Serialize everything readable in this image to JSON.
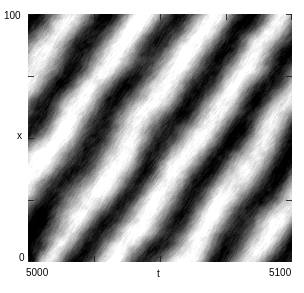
{
  "figure": {
    "kind": "space-time-density-plot",
    "background_color": "#ffffff",
    "plot_frame": {
      "left": 28,
      "top": 14,
      "width": 264,
      "height": 248
    }
  },
  "axes": {
    "x": {
      "label": "t",
      "min_tick_label": "5000",
      "max_tick_label": "5100",
      "range": [
        5000,
        5100
      ],
      "tick_count": 5,
      "ticks_inward": true
    },
    "y": {
      "label": "x",
      "min_tick_label": "0",
      "max_tick_label": "100",
      "range": [
        0,
        100
      ],
      "tick_count": 5,
      "ticks_inward": true
    }
  },
  "chart_data": {
    "type": "heatmap",
    "title": "",
    "subtitle": "",
    "xlabel": "t",
    "ylabel": "x",
    "xlim": [
      5000,
      5100
    ],
    "ylim": [
      0,
      100
    ],
    "xtick_labels": [
      "5000",
      "5100"
    ],
    "ytick_labels": [
      "0",
      "100"
    ],
    "grid": false,
    "legend": "none",
    "colormap": "grayscale",
    "colormap_low": "#000000",
    "colormap_high": "#ffffff",
    "value_range": [
      0,
      1
    ],
    "pattern": {
      "structure": "diagonal-stripes",
      "orientation_degrees": 58,
      "stripe_wavelength_x_units": 26,
      "num_bright_bands": 5,
      "contrast": 0.95,
      "noise_amplitude": 0.22,
      "fine_streak_amplitude": 0.12
    },
    "bright_band_centers_t": [
      5012,
      5036,
      5062,
      5083,
      5098
    ],
    "dark_band_centers_t": [
      5000,
      5024,
      5049,
      5072,
      5091
    ],
    "annotations": []
  }
}
